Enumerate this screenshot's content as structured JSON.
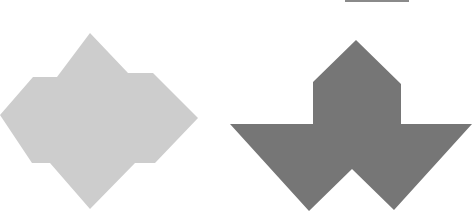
{
  "canvas": {
    "width": 472,
    "height": 215,
    "background": "#ffffff"
  },
  "figures": [
    {
      "name": "light-shape",
      "fill": "#cdcdcd",
      "points": "90,33 128,73 153,73 198,118 155,163 135,163 90,209 50,163 32,163 0,115 33,77 57,77"
    },
    {
      "name": "dark-shape",
      "fill": "#767676",
      "points": "356,40 401,84 401,124 472,124 394,210 352,169 309,211 230,124 313,124 313,82"
    }
  ],
  "top_line": {
    "x1": 345,
    "x2": 409,
    "y": 1,
    "color": "#8a8a8a"
  }
}
